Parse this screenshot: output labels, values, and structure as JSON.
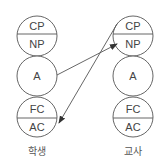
{
  "diagram": {
    "type": "transactional-analysis-ego-states",
    "columns": [
      {
        "id": "student",
        "caption": "학생",
        "states": {
          "cp": "CP",
          "np": "NP",
          "a": "A",
          "fc": "FC",
          "ac": "AC"
        }
      },
      {
        "id": "teacher",
        "caption": "교사",
        "states": {
          "cp": "CP",
          "np": "NP",
          "a": "A",
          "fc": "FC",
          "ac": "AC"
        }
      }
    ],
    "arrows": [
      {
        "from": "student.A",
        "to": "teacher.NP"
      },
      {
        "from": "teacher.CP",
        "to": "student.AC"
      }
    ],
    "colors": {
      "stroke": "#555555",
      "fill": "#ffffff",
      "text": "#444444"
    }
  }
}
